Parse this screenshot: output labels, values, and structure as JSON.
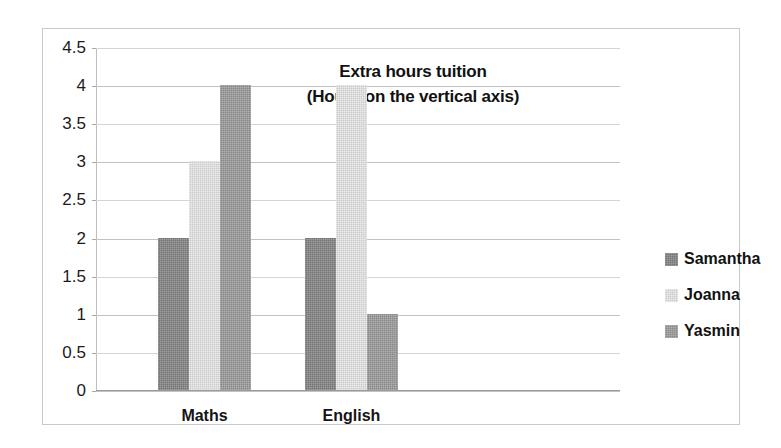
{
  "chart_data": {
    "type": "bar",
    "title": "Extra hours tuition",
    "subtitle": "(Hours on the vertical axis)",
    "xlabel": "",
    "ylabel": "Hours",
    "categories": [
      "Maths",
      "English"
    ],
    "series": [
      {
        "name": "Samantha",
        "values": [
          2,
          2
        ],
        "color": "#767676"
      },
      {
        "name": "Joanna",
        "values": [
          3,
          4
        ],
        "color": "#cccccc"
      },
      {
        "name": "Yasmin",
        "values": [
          4,
          1
        ],
        "color": "#888888"
      }
    ],
    "ylim": [
      0,
      4.5
    ],
    "ytick_values": [
      0,
      0.5,
      1,
      1.5,
      2,
      2.5,
      3,
      3.5,
      4,
      4.5
    ],
    "ytick_labels": [
      "0",
      "0.5",
      "1",
      "1.5",
      "2",
      "2.5",
      "3",
      "3.5",
      "4",
      "4.5"
    ],
    "grid": true,
    "legend_position": "right",
    "legend_entries": [
      "Samantha",
      "Joanna",
      "Yasmin"
    ]
  }
}
